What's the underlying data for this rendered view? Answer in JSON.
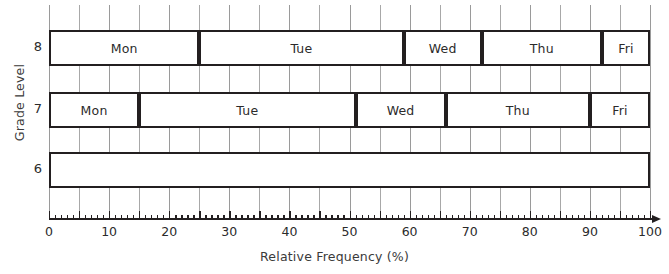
{
  "chart_data": {
    "type": "bar",
    "orientation": "horizontal",
    "stacked": true,
    "title": "",
    "xlabel": "Relative Frequency (%)",
    "ylabel": "Grade Level",
    "xlim": [
      0,
      100
    ],
    "x_ticks": [
      0,
      10,
      20,
      30,
      40,
      50,
      60,
      70,
      80,
      90,
      100
    ],
    "x_tick_labels": [
      "0",
      "10",
      "20",
      "30",
      "40",
      "50",
      "60",
      "70",
      "80",
      "90",
      "100"
    ],
    "x_minor_tick_step": 1,
    "gridlines": {
      "vertical": true,
      "step": 5,
      "color": "#a8a8a8"
    },
    "categories": [
      "8",
      "7",
      "6"
    ],
    "series": [
      {
        "name": "Mon",
        "values": [
          25,
          15,
          null
        ]
      },
      {
        "name": "Tue",
        "values": [
          34,
          36,
          null
        ]
      },
      {
        "name": "Wed",
        "values": [
          13,
          15,
          null
        ]
      },
      {
        "name": "Thu",
        "values": [
          20,
          24,
          null
        ]
      },
      {
        "name": "Fri",
        "values": [
          8,
          10,
          null
        ]
      }
    ],
    "bars": [
      {
        "category": "8",
        "total": 100,
        "segments": [
          {
            "label": "Mon",
            "start": 0,
            "end": 25,
            "value": 25
          },
          {
            "label": "Tue",
            "start": 25,
            "end": 59,
            "value": 34
          },
          {
            "label": "Wed",
            "start": 59,
            "end": 72,
            "value": 13
          },
          {
            "label": "Thu",
            "start": 72,
            "end": 92,
            "value": 20
          },
          {
            "label": "Fri",
            "start": 92,
            "end": 100,
            "value": 8
          }
        ]
      },
      {
        "category": "7",
        "total": 100,
        "segments": [
          {
            "label": "Mon",
            "start": 0,
            "end": 15,
            "value": 15
          },
          {
            "label": "Tue",
            "start": 15,
            "end": 51,
            "value": 36
          },
          {
            "label": "Wed",
            "start": 51,
            "end": 66,
            "value": 15
          },
          {
            "label": "Thu",
            "start": 66,
            "end": 90,
            "value": 24
          },
          {
            "label": "Fri",
            "start": 90,
            "end": 100,
            "value": 10
          }
        ]
      },
      {
        "category": "6",
        "total": 100,
        "segments": [
          {
            "label": "",
            "start": 0,
            "end": 100,
            "value": 100
          }
        ]
      }
    ],
    "bar_fill_color": "#ffffff",
    "bar_border_color": "#231f20",
    "text_color": "#2b2b2b",
    "background_color": "#ffffff"
  }
}
